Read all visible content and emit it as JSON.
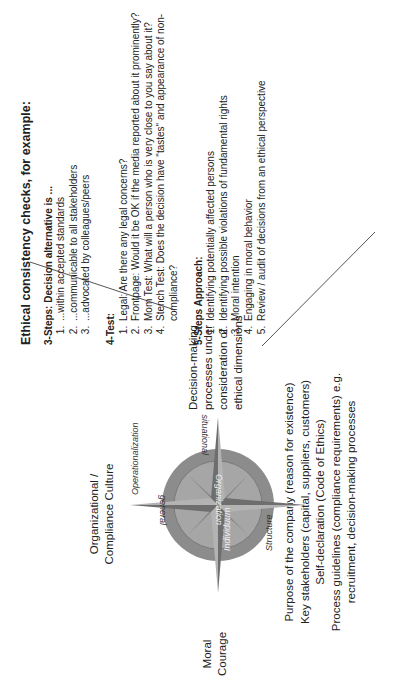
{
  "ethical_checks": {
    "title": "Ethical consistency checks, for example:",
    "three_steps": {
      "heading": "3-Steps: Decision alternative is ...",
      "items": [
        "...within accepted standards",
        "...communicable to all stakeholders",
        "...advocated by colleagues/peers"
      ]
    },
    "four_test": {
      "heading": "4-Test:",
      "items": [
        "Legal: Are there any legal concerns?",
        "Frontpage: Would it be OK if the media reported about it prominently?",
        "Mom Test: What will a person who is very close to you say about it?",
        "Stench Test: Does the decision have \"tastes\" and appearance of non-compliance?"
      ]
    },
    "five_steps": {
      "heading": "5-Steps Approach:",
      "items": [
        "Identifying potentially affected persons",
        "Identifying possible violations of fundamental rights",
        "Moral intention",
        "Engaging in moral behavior",
        "Review / audit of decisions from an ethical perspective"
      ]
    }
  },
  "decision_making": {
    "lines": [
      "Decision-making",
      "processes under",
      "consideration of",
      "ethical dimensions"
    ]
  },
  "culture": {
    "lines": [
      "Organizational /",
      "Compliance Culture"
    ]
  },
  "courage": {
    "lines": [
      "Moral",
      "Courage"
    ]
  },
  "foundations": {
    "lines": [
      "Purpose of the company (reason for existence)",
      "Key stakeholders (capital, suppliers, customers)",
      "Self-declaration (Code of Ethics)",
      "Process guidelines (compliance requirements) e.g.",
      "recruitment, decision-making processes"
    ]
  },
  "compass": {
    "labels": {
      "north": "situational",
      "south": "general",
      "west": "Operationalization",
      "east": "Structure",
      "horizontal_axis": "Organization",
      "vertical_axis": "Individuum"
    },
    "colors": {
      "outer_ring": "#8c8c8c",
      "inner_disc": "#a6a6a6",
      "star_light": "#b3b3b3",
      "star_dark": "#6e6e6e",
      "small_star": "#7f7f7f"
    }
  }
}
